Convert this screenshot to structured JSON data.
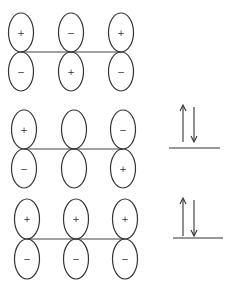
{
  "diagram": {
    "title": "",
    "orbitals": [
      {
        "name": "pi3",
        "atoms": [
          {
            "top_sign": "+",
            "bottom_sign": "−"
          },
          {
            "top_sign": "−",
            "bottom_sign": "+"
          },
          {
            "top_sign": "+",
            "bottom_sign": "−"
          }
        ],
        "electrons": 0
      },
      {
        "name": "pi2",
        "atoms": [
          {
            "top_sign": "+",
            "bottom_sign": "−"
          },
          {
            "top_sign": "",
            "bottom_sign": ""
          },
          {
            "top_sign": "−",
            "bottom_sign": "+"
          }
        ],
        "electrons": 2
      },
      {
        "name": "pi1",
        "atoms": [
          {
            "top_sign": "+",
            "bottom_sign": "−"
          },
          {
            "top_sign": "+",
            "bottom_sign": "−"
          },
          {
            "top_sign": "+",
            "bottom_sign": "−"
          }
        ],
        "electrons": 2
      }
    ],
    "colors": {
      "stroke": "#333333",
      "background": "#ffffff"
    }
  }
}
